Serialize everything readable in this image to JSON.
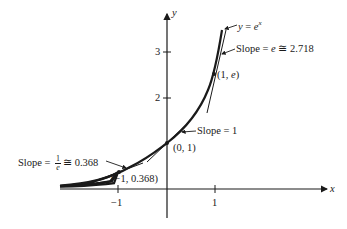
{
  "figure": {
    "x_axis_label": "x",
    "y_axis_label": "y",
    "x_ticks": [
      "−1",
      "1"
    ],
    "y_ticks": [
      "1",
      "2",
      "3"
    ],
    "curve_label": {
      "lhs": "y",
      "eq": " = ",
      "base": "e",
      "exp": "x"
    },
    "points": [
      {
        "label": "(−1, 0.368)"
      },
      {
        "label": "(0, 1)"
      },
      {
        "label": "(1, ",
        "var": "e",
        "close": ")"
      }
    ],
    "slope_labels": {
      "left": {
        "prefix": "Slope = ",
        "num": "1",
        "den": "e",
        "suffix": "≅ 0.368"
      },
      "middle": {
        "text": "Slope = 1"
      },
      "right": {
        "prefix": "Slope = ",
        "var": "e",
        "suffix": " ≅ 2.718"
      }
    }
  },
  "colors": {
    "ink": "#1a1a1a",
    "background": "#ffffff"
  }
}
